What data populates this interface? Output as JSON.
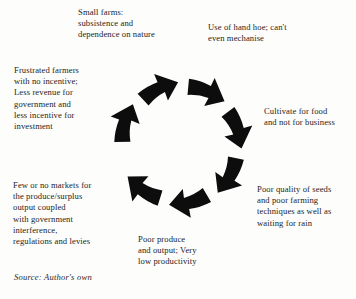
{
  "figure": {
    "type": "cyclical-flow-diagram",
    "direction": "clockwise",
    "arrow_count": 7,
    "arrow_color": "#0d0d0d",
    "background_color": "#fdfdfc",
    "text_color": "#242424"
  },
  "nodes": [
    {
      "id": "small-farms",
      "position": "top-left",
      "lines": [
        "Small farms:",
        "subsistence and",
        "dependence on nature"
      ]
    },
    {
      "id": "hand-hoe",
      "position": "top-right",
      "lines": [
        "Use of hand hoe; can't",
        "even mechanise"
      ]
    },
    {
      "id": "cultivate-food",
      "position": "right",
      "lines": [
        "Cultivate for food",
        "and not for business"
      ]
    },
    {
      "id": "poor-seeds",
      "position": "bottom-right",
      "lines": [
        "Poor quality of seeds",
        "and poor farming",
        "techniques as well as",
        "waiting for rain"
      ]
    },
    {
      "id": "poor-produce",
      "position": "bottom",
      "lines": [
        "Poor produce",
        "and output; Very",
        "low productivity"
      ]
    },
    {
      "id": "few-markets",
      "position": "bottom-left",
      "lines": [
        "Few or no markets for",
        "the produce/surplus",
        "output coupled",
        "with government",
        "interference,",
        "regulations and levies"
      ]
    },
    {
      "id": "frustrated-farmers",
      "position": "left",
      "lines": [
        "Frustrated farmers",
        "with no incentive;",
        "Less revenue for",
        "government and",
        "less incentive for",
        "investment"
      ]
    }
  ],
  "source": {
    "text": "Source: Author's own"
  }
}
